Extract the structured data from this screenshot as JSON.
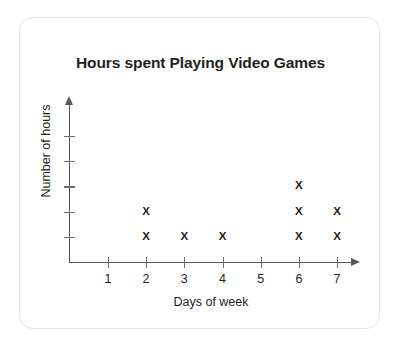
{
  "card": {
    "background_color": "#ffffff",
    "border_color": "#e3e3e5"
  },
  "chart_data": {
    "type": "scatter",
    "plot_style": "dot-plot",
    "title": "Hours spent Playing Video Games",
    "xlabel": "Days of week",
    "ylabel": "Number of hours",
    "marker": "X",
    "marker_color": "#231f20",
    "axis_color": "#58585b",
    "grid": false,
    "legend": null,
    "categories": [
      "1",
      "2",
      "3",
      "4",
      "5",
      "6",
      "7"
    ],
    "x": [
      1,
      2,
      3,
      4,
      5,
      6,
      7
    ],
    "values": [
      0,
      2,
      1,
      1,
      0,
      3,
      2
    ],
    "xlim": [
      0,
      7.6
    ],
    "ylim": [
      0,
      5
    ],
    "x_tick_labels": [
      "1",
      "2",
      "3",
      "4",
      "5",
      "6",
      "7"
    ],
    "y_tick_labels": [
      "",
      "",
      "",
      "",
      ""
    ],
    "y_tick_count": 5,
    "points": [
      {
        "day": 2,
        "level": 1
      },
      {
        "day": 2,
        "level": 2
      },
      {
        "day": 3,
        "level": 1
      },
      {
        "day": 4,
        "level": 1
      },
      {
        "day": 6,
        "level": 1
      },
      {
        "day": 6,
        "level": 2
      },
      {
        "day": 6,
        "level": 3
      },
      {
        "day": 7,
        "level": 1
      },
      {
        "day": 7,
        "level": 2
      }
    ]
  }
}
